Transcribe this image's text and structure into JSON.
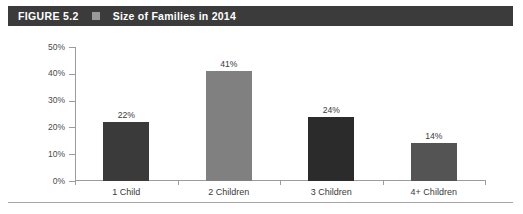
{
  "header": {
    "figure_number": "FIGURE 5.2",
    "marker_icon": "square-marker-icon",
    "marker_color": "#9a9a9a",
    "title": "Size of Families in 2014",
    "bar_color": "#3b3b3b",
    "text_color": "#ffffff"
  },
  "chart_data": {
    "type": "bar",
    "title": "Size of Families in 2014",
    "categories": [
      "1 Child",
      "2 Children",
      "3 Children",
      "4+ Children"
    ],
    "values": [
      22,
      41,
      24,
      14
    ],
    "value_labels": [
      "22%",
      "41%",
      "24%",
      "14%"
    ],
    "bar_colors": [
      "#3a3a3a",
      "#808080",
      "#2b2b2b",
      "#545454"
    ],
    "xlabel": "",
    "ylabel": "",
    "ylim": [
      0,
      50
    ],
    "ytick_values": [
      0,
      10,
      20,
      30,
      40,
      50
    ],
    "ytick_labels": [
      "0%",
      "10%",
      "20%",
      "30%",
      "40%",
      "50%"
    ],
    "grid": false,
    "legend": false
  }
}
